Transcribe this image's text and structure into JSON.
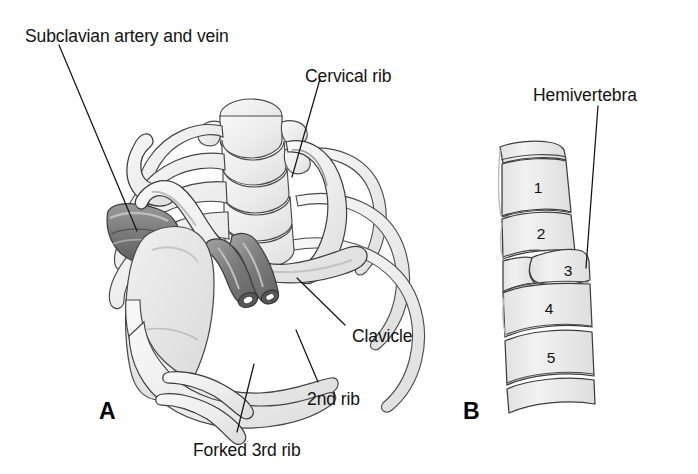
{
  "figure": {
    "title_text_present": false,
    "background_color": "#ffffff",
    "ink_color": "#121212",
    "bone_fill": "#ededed",
    "bone_fill_light": "#f4f4f4",
    "bone_outline": "#3a3a3a",
    "vessel_dark": "#6e6e6e",
    "vessel_mid": "#8a8a8a",
    "vessel_light": "#b5b5b5"
  },
  "panels": [
    {
      "letter": "A",
      "name": "thoracic-outlet-rib-anomalies",
      "labels": [
        {
          "id": "subclavian",
          "text": "Subclavian artery and vein"
        },
        {
          "id": "cervical-rib",
          "text": "Cervical rib"
        },
        {
          "id": "clavicle",
          "text": "Clavicle"
        },
        {
          "id": "second-rib",
          "text": "2nd rib"
        },
        {
          "id": "forked-third-rib",
          "text": "Forked 3rd rib"
        }
      ]
    },
    {
      "letter": "B",
      "name": "vertebral-column-hemivertebra",
      "labels": [
        {
          "id": "hemivertebra",
          "text": "Hemivertebra"
        }
      ],
      "vertebra_numbers": [
        "1",
        "2",
        "3",
        "4",
        "5"
      ]
    }
  ]
}
